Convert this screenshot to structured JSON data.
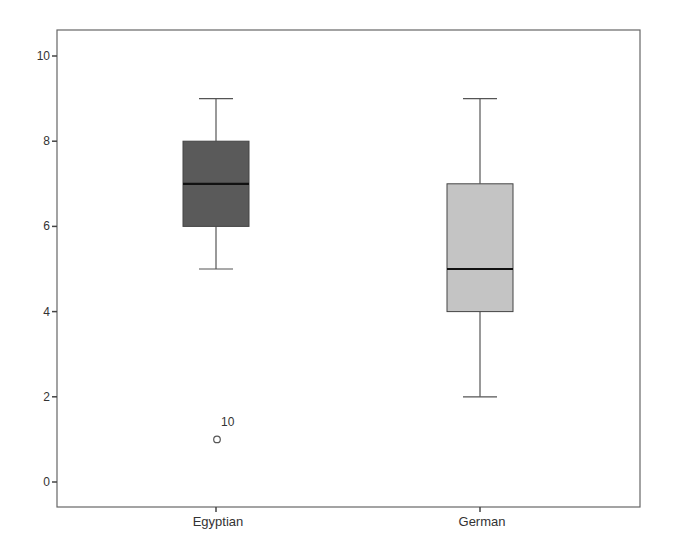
{
  "chart_data": {
    "type": "boxplot",
    "title": "",
    "xlabel": "",
    "ylabel": "",
    "ylim": [
      -0.6,
      10.6
    ],
    "yticks": [
      0,
      2,
      4,
      6,
      8,
      10
    ],
    "ytick_labels": [
      "0",
      "2",
      "4",
      "6",
      "8",
      "10"
    ],
    "grid": false,
    "categories": [
      "Egyptian",
      "German"
    ],
    "series": [
      {
        "name": "Egyptian",
        "min": 5,
        "q1": 6,
        "median": 7,
        "q3": 8,
        "max": 9,
        "fill": "#5a5a5a",
        "outliers": [
          {
            "value": 1,
            "label": "10"
          }
        ]
      },
      {
        "name": "German",
        "min": 2,
        "q1": 4,
        "median": 5,
        "q3": 7,
        "max": 9,
        "fill": "#c4c4c4",
        "outliers": []
      }
    ]
  }
}
